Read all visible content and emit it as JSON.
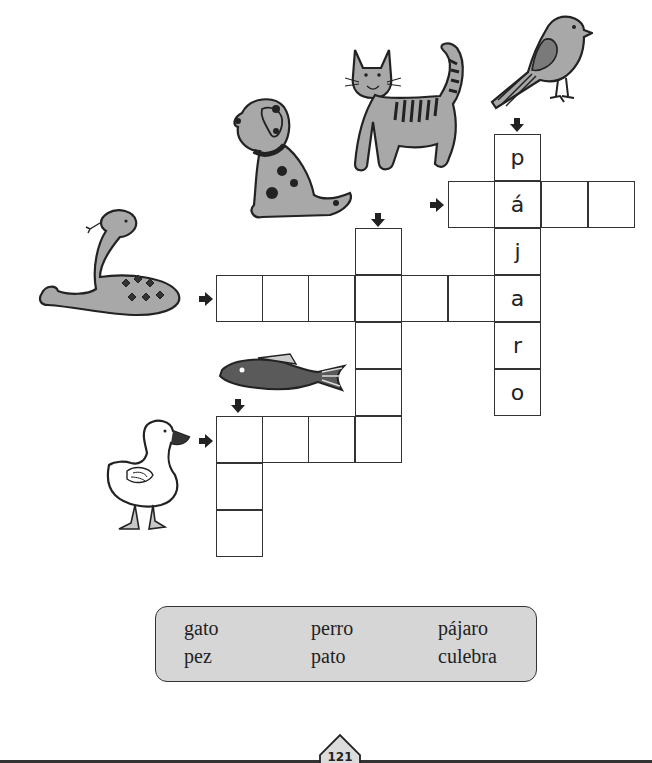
{
  "worksheet": {
    "page_number": "121",
    "activity": "crossword",
    "animals": [
      {
        "name": "bird",
        "icon": "bird-icon"
      },
      {
        "name": "cat",
        "icon": "cat-icon"
      },
      {
        "name": "dog",
        "icon": "dog-icon"
      },
      {
        "name": "snake",
        "icon": "snake-icon"
      },
      {
        "name": "fish",
        "icon": "fish-icon"
      },
      {
        "name": "duck",
        "icon": "duck-icon"
      }
    ],
    "crossword": {
      "pajaro_letters": [
        "p",
        "á",
        "j",
        "a",
        "r",
        "o"
      ]
    },
    "word_bank": {
      "col1": [
        "gato",
        "pez"
      ],
      "col2": [
        "perro",
        "pato"
      ],
      "col3": [
        "pájaro",
        "culebra"
      ]
    }
  },
  "colors": {
    "grid_line": "#333333",
    "word_bank_fill": "#d6d6d6",
    "animal_fill": "#a8a8a8"
  }
}
